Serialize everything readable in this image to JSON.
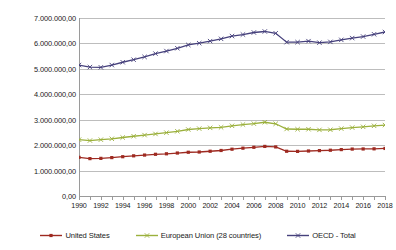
{
  "chart_data": {
    "type": "line",
    "title": "",
    "xlabel": "",
    "ylabel": "",
    "grid": true,
    "legend_position": "bottom",
    "xlim": [
      1990,
      2018
    ],
    "ylim": [
      0,
      7000000
    ],
    "x": [
      1990,
      1991,
      1992,
      1993,
      1994,
      1995,
      1996,
      1997,
      1998,
      1999,
      2000,
      2001,
      2002,
      2003,
      2004,
      2005,
      2006,
      2007,
      2008,
      2009,
      2010,
      2011,
      2012,
      2013,
      2014,
      2015,
      2016,
      2017,
      2018
    ],
    "x_tick_labels": [
      "1990",
      "1992",
      "1994",
      "1996",
      "1998",
      "2000",
      "2002",
      "2004",
      "2006",
      "2008",
      "2010",
      "2012",
      "2014",
      "2016",
      "2018"
    ],
    "y_tick_labels": [
      "0,00",
      "1.000.000,00",
      "2.000.000,00",
      "3.000.000,00",
      "4.000.000,00",
      "5.000.000,00",
      "6.000.000,00",
      "7.000.000,00"
    ],
    "y_tick_values": [
      0,
      1000000,
      2000000,
      3000000,
      4000000,
      5000000,
      6000000,
      7000000
    ],
    "series": [
      {
        "name": "United States",
        "color": "#9E2A21",
        "marker": "square",
        "values": [
          1520000,
          1470000,
          1480000,
          1510000,
          1545000,
          1580000,
          1610000,
          1640000,
          1660000,
          1690000,
          1720000,
          1730000,
          1760000,
          1790000,
          1840000,
          1880000,
          1915000,
          1950000,
          1930000,
          1760000,
          1755000,
          1770000,
          1785000,
          1800000,
          1825000,
          1845000,
          1850000,
          1855000,
          1870000
        ]
      },
      {
        "name": "European Union (28 countries)",
        "color": "#9BB03C",
        "marker": "cross",
        "values": [
          2215000,
          2180000,
          2215000,
          2250000,
          2300000,
          2350000,
          2395000,
          2440000,
          2490000,
          2545000,
          2615000,
          2650000,
          2680000,
          2700000,
          2760000,
          2810000,
          2845000,
          2900000,
          2840000,
          2635000,
          2625000,
          2625000,
          2600000,
          2605000,
          2650000,
          2690000,
          2720000,
          2760000,
          2790000
        ]
      },
      {
        "name": "OECD - Total",
        "color": "#46417C",
        "marker": "cross",
        "values": [
          5150000,
          5070000,
          5060000,
          5150000,
          5260000,
          5360000,
          5470000,
          5600000,
          5700000,
          5810000,
          5940000,
          6010000,
          6090000,
          6180000,
          6290000,
          6350000,
          6430000,
          6470000,
          6400000,
          6050000,
          6050000,
          6090000,
          6030000,
          6060000,
          6140000,
          6210000,
          6270000,
          6360000,
          6450000
        ]
      }
    ]
  }
}
